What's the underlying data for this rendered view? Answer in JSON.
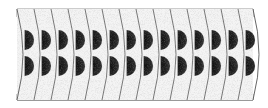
{
  "figure": {
    "segment_count": 14,
    "segment_boundaries_x": [
      17,
      34,
      51,
      68,
      85,
      102,
      119,
      136,
      153,
      170,
      187,
      204,
      221,
      238,
      253
    ],
    "top_band": {
      "y_top": 9,
      "y_bottom": 17,
      "color": "#bdbdbd"
    },
    "bottom_band": {
      "y_top": 88,
      "y_bottom": 100,
      "color": "#c4c4c4"
    },
    "upper_discs_center_y": 40,
    "lower_discs_center_y": 66,
    "disc_radius": 10,
    "disc_color": "#1c1c1c",
    "segment_fill": "#f4f4f4",
    "outline_color": "#555555",
    "background": "#ffffff"
  }
}
